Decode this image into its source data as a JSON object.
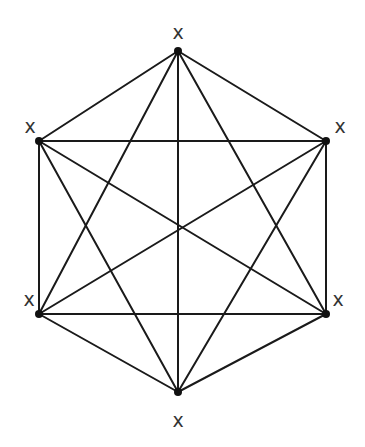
{
  "diagram": {
    "type": "complete-graph-hexagon",
    "vertices": [
      {
        "id": "top",
        "x": 178,
        "y": 51,
        "label": "x",
        "lx": 178,
        "ly": 33
      },
      {
        "id": "upper-right",
        "x": 326,
        "y": 141,
        "label": "x",
        "lx": 340,
        "ly": 127
      },
      {
        "id": "lower-right",
        "x": 326,
        "y": 314,
        "label": "x",
        "lx": 338,
        "ly": 300
      },
      {
        "id": "bottom",
        "x": 178,
        "y": 392,
        "label": "x",
        "lx": 178,
        "ly": 421
      },
      {
        "id": "lower-left",
        "x": 39,
        "y": 314,
        "label": "x",
        "lx": 29,
        "ly": 300
      },
      {
        "id": "upper-left",
        "x": 39,
        "y": 141,
        "label": "x",
        "lx": 30,
        "ly": 127
      }
    ],
    "edges": "all-pairs",
    "colors": {
      "edge": "#1a1a1a",
      "vertex": "#111111",
      "label": "#333333",
      "background": "#ffffff"
    }
  }
}
